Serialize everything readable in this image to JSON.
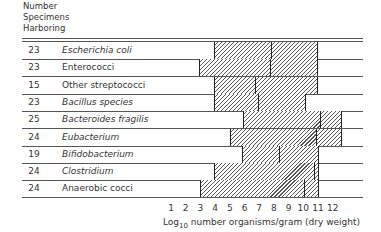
{
  "header": {
    "line1": "Number",
    "line2": "Specimens",
    "line3": "Harboring"
  },
  "rows": [
    {
      "count": "23",
      "name": "Escherichia coli",
      "italic": true
    },
    {
      "count": "23",
      "name": "Enterococci",
      "italic": false
    },
    {
      "count": "15",
      "name": "Other streptococci",
      "italic": false
    },
    {
      "count": "23",
      "name": "Bacillus species",
      "italic": true
    },
    {
      "count": "25",
      "name": "Bacteroides fragilis",
      "italic": true
    },
    {
      "count": "24",
      "name": "Eubacterium",
      "italic": true
    },
    {
      "count": "19",
      "name": "Bifidobacterium",
      "italic": true
    },
    {
      "count": "24",
      "name": "Clostridium",
      "italic": true
    },
    {
      "count": "24",
      "name": "Anaerobic cocci",
      "italic": false
    }
  ],
  "axis": {
    "ticks": [
      "1",
      "2",
      "3",
      "4",
      "5",
      "6",
      "7",
      "8",
      "9",
      "10",
      "11",
      "12"
    ],
    "label_prefix": "Log",
    "label_sub": "10",
    "label_rest": " number organisms/gram  (dry weight)"
  },
  "chart_data": {
    "type": "bar",
    "subtype": "floating-range-with-median",
    "title": "",
    "xlabel": "Log10 number organisms/gram (dry weight)",
    "ylabel": "Number Specimens Harboring",
    "xlim": [
      1,
      12
    ],
    "grid": false,
    "categories": [
      "Escherichia coli",
      "Enterococci",
      "Other streptococci",
      "Bacillus species",
      "Bacteroides fragilis",
      "Eubacterium",
      "Bifidobacterium",
      "Clostridium",
      "Anaerobic cocci"
    ],
    "specimens_harboring": [
      23,
      23,
      15,
      23,
      25,
      24,
      19,
      24,
      24
    ],
    "series": [
      {
        "name": "min",
        "values": [
          3.9,
          2.9,
          3.9,
          3.9,
          5.9,
          5.0,
          5.8,
          3.9,
          3.0
        ]
      },
      {
        "name": "median",
        "values": [
          7.9,
          7.8,
          6.8,
          7.0,
          11.2,
          10.9,
          8.4,
          10.8,
          10.1
        ]
      },
      {
        "name": "max",
        "values": [
          11.0,
          11.0,
          11.0,
          10.2,
          12.6,
          12.6,
          11.1,
          11.1,
          11.1
        ]
      }
    ]
  }
}
